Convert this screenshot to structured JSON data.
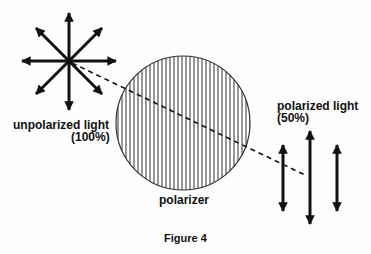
{
  "figure": {
    "caption": "Figure 4",
    "labels": {
      "unpolarized_line1": "unpolarized light",
      "unpolarized_line2": "(100%)",
      "polarized_line1": "polarized light",
      "polarized_line2": "(50%)",
      "polarizer": "polarizer"
    },
    "colors": {
      "ink": "#111111",
      "background": "#fdfdfd"
    }
  }
}
